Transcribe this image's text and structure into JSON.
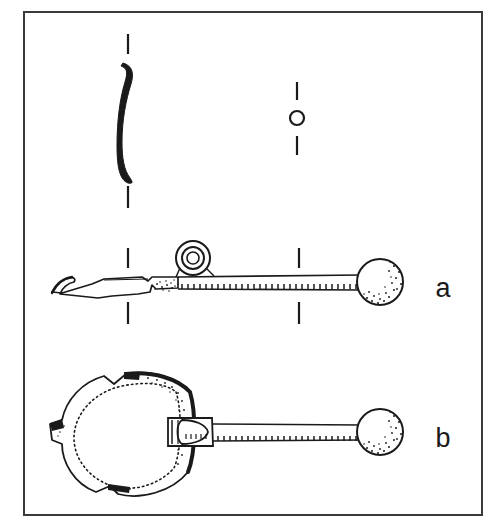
{
  "figure": {
    "kind": "archaeological-line-drawing",
    "background_color": "#ffffff",
    "ink_color": "#1a1a1a",
    "frame": {
      "name": "plate-border",
      "x": 24,
      "y": 12,
      "width": 458,
      "height": 503,
      "stroke_color": "#3a3a3a",
      "stroke_width": 2
    },
    "labels": [
      {
        "id": "a",
        "text": "a",
        "x": 443,
        "y": 297
      },
      {
        "id": "b",
        "text": "b",
        "x": 443,
        "y": 447
      }
    ],
    "objects": [
      {
        "name": "bowl-profile-section",
        "description": "S-curved vertical cross-section profile of the ladle bowl",
        "center_x": 128,
        "top_y": 62,
        "bottom_y": 182
      },
      {
        "name": "handle-section-circle",
        "description": "Small circle showing round cross-section of the handle",
        "cx": 297,
        "cy": 118,
        "r": 7
      },
      {
        "name": "artifact-a",
        "description": "Side elevation of ladle: shallow bowl at left, suspension ring, long tapering handle, spherical terminal knob at right",
        "baseline_y": 288,
        "bowl_left_x": 50,
        "knob_cx": 380,
        "knob_cy": 282,
        "knob_r": 24
      },
      {
        "name": "artifact-b",
        "description": "Plan view of ladle: circular bowl at left with broken rim, long handle, spherical terminal knob at right",
        "bowl_cx": 130,
        "bowl_cy": 432,
        "bowl_r": 62,
        "knob_cx": 380,
        "knob_cy": 432,
        "knob_r": 24
      }
    ],
    "section_marks": [
      {
        "name": "section-mark-a-left-top",
        "x": 128,
        "y1": 248,
        "y2": 268
      },
      {
        "name": "section-mark-a-left-bottom",
        "x": 128,
        "y1": 302,
        "y2": 324
      },
      {
        "name": "section-mark-a-right-top",
        "x": 299,
        "y1": 248,
        "y2": 268
      },
      {
        "name": "section-mark-a-right-bottom",
        "x": 299,
        "y1": 302,
        "y2": 324
      },
      {
        "name": "section-mark-profile-top",
        "x": 128,
        "y1": 34,
        "y2": 54
      },
      {
        "name": "section-mark-profile-bottom",
        "x": 128,
        "y1": 186,
        "y2": 208
      },
      {
        "name": "section-mark-circle-top",
        "x": 297,
        "y1": 82,
        "y2": 100
      },
      {
        "name": "section-mark-circle-bottom",
        "x": 297,
        "y1": 136,
        "y2": 155
      }
    ]
  }
}
